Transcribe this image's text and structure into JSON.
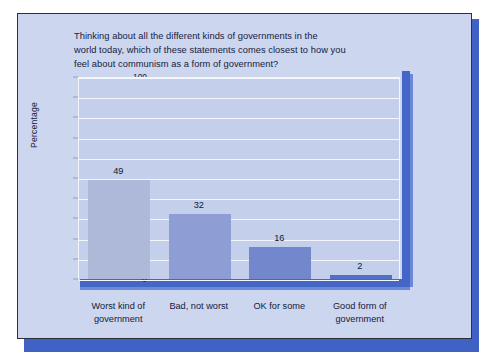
{
  "figure": {
    "name": "communism-opinion-bar-chart",
    "panel_background": "#ccd6ee",
    "frame_color": "#2d2f3a",
    "shadow_color": "#3f62c4",
    "plot_background": "#c3cfeb",
    "gridline_color": "#f4f7fd",
    "floor_color": "#4466c6",
    "wall_color": "#4466c6"
  },
  "chart_data": {
    "type": "bar",
    "title": "Thinking about all the different kinds of governments in the world today, which of these statements comes closest to how you feel about communism as a form of government?",
    "title_lines": [
      "Thinking about all the different kinds of governments in the",
      "world today, which of these statements comes closest to how you",
      "feel about communism as a form of government?"
    ],
    "categories": [
      "Worst kind of government",
      "Bad, not worst",
      "OK for some",
      "Good form of government"
    ],
    "category_lines": [
      [
        "Worst kind of",
        "government"
      ],
      [
        "Bad, not worst",
        ""
      ],
      [
        "OK for some",
        ""
      ],
      [
        "Good form of",
        "government"
      ]
    ],
    "values": [
      49,
      32,
      16,
      2
    ],
    "value_labels": [
      "49",
      "32",
      "16",
      "2"
    ],
    "bar_colors": [
      "#aeb9d9",
      "#8f9dd5",
      "#7287cc",
      "#4f6fc9"
    ],
    "xlabel": "",
    "ylabel": "Percentage",
    "ylim": [
      0,
      100
    ],
    "yticks": [
      0,
      10,
      20,
      30,
      40,
      50,
      60,
      70,
      80,
      90,
      100
    ],
    "ytick_labels": [
      "0",
      "10",
      "20",
      "30",
      "40",
      "50",
      "60",
      "70",
      "80",
      "90",
      "100"
    ],
    "grid": true,
    "grid_axis": "y",
    "legend": false,
    "legend_position": "none"
  }
}
